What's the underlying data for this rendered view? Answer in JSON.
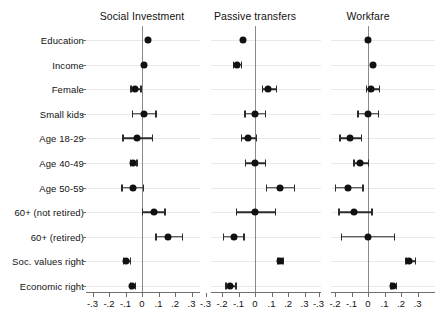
{
  "chart_data": {
    "type": "scatter",
    "plot_kind": "coefficient-plot-with-confidence-intervals",
    "title": "",
    "xlabel": "",
    "ylabel": "",
    "xlim": [
      -0.35,
      0.35
    ],
    "xticks": [
      -0.3,
      -0.2,
      -0.1,
      0,
      0.1,
      0.2,
      0.3
    ],
    "xticklabels": [
      "-.3",
      "-.2",
      "-.1",
      "0",
      ".1",
      ".2",
      ".3"
    ],
    "grid": true,
    "grid_axis": "y",
    "legend": "none",
    "zero_reference_line": 0,
    "categories": [
      "Education",
      "Income",
      "Female",
      "Small kids",
      "Age 18-29",
      "Age 40-49",
      "Age 50-59",
      "60+ (not retired)",
      "60+ (retired)",
      "Soc. values right",
      "Economic right"
    ],
    "panels": [
      {
        "name": "Social Investment",
        "values": [
          0.035,
          0.01,
          -0.04,
          0.01,
          -0.03,
          -0.055,
          -0.055,
          0.07,
          0.16,
          -0.095,
          -0.06
        ],
        "ci_low": [
          0.035,
          0.01,
          -0.07,
          -0.06,
          -0.12,
          -0.075,
          -0.125,
          0.0,
          0.08,
          -0.115,
          -0.075
        ],
        "ci_high": [
          0.035,
          0.01,
          -0.01,
          0.08,
          0.06,
          -0.035,
          0.005,
          0.135,
          0.24,
          -0.075,
          -0.045
        ]
      },
      {
        "name": "Passive transfers",
        "values": [
          -0.07,
          -0.11,
          0.08,
          0.0,
          -0.04,
          0.0,
          0.15,
          0.0,
          -0.13,
          0.15,
          -0.15
        ],
        "ci_low": [
          -0.07,
          -0.135,
          0.04,
          -0.065,
          -0.085,
          -0.06,
          0.065,
          -0.115,
          -0.195,
          0.135,
          -0.18
        ],
        "ci_high": [
          -0.07,
          -0.085,
          0.125,
          0.06,
          0.005,
          0.06,
          0.235,
          0.12,
          -0.07,
          0.165,
          -0.12
        ]
      },
      {
        "name": "Workfare",
        "values": [
          0.0,
          0.03,
          0.02,
          0.0,
          -0.11,
          -0.05,
          -0.12,
          -0.085,
          0.0,
          0.25,
          0.15
        ],
        "ci_low": [
          0.0,
          0.03,
          -0.015,
          -0.065,
          -0.175,
          -0.09,
          -0.2,
          -0.18,
          -0.165,
          0.225,
          0.135
        ],
        "ci_high": [
          0.0,
          0.03,
          0.065,
          0.06,
          -0.045,
          0.0,
          -0.035,
          0.02,
          0.155,
          0.285,
          0.17
        ]
      }
    ]
  },
  "colors": {
    "marker": "#111111",
    "interval": "#2b2b2b",
    "zero_line": "#8a8a8a",
    "gridline": "#e9e9e9",
    "axis": "#6e6e6e",
    "background": "#ffffff"
  }
}
